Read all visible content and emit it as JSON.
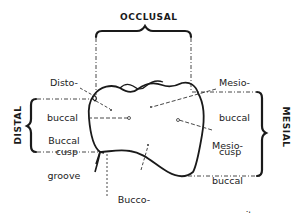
{
  "diagram": {
    "type": "tooth-surface-anatomy",
    "view": "buccal view of molar crown",
    "stroke_color": "#1a1a1a",
    "guide_color": "#333333",
    "directions": {
      "top": "OCCLUSAL",
      "left": "DISTAL",
      "right": "MESIAL"
    },
    "labels": {
      "distobuccal_cusp": [
        "Disto-",
        "buccal",
        "cusp"
      ],
      "buccal_groove": [
        "Buccal",
        "groove"
      ],
      "mesiobuccal_cusp": [
        "Mesio-",
        "buccal",
        "cusp"
      ],
      "mesiobuccal_concavity": [
        "Mesio-",
        "buccal",
        "concavity"
      ],
      "buccogingival_ridge": [
        "Bucco-",
        "gingival",
        "ridge"
      ]
    }
  }
}
